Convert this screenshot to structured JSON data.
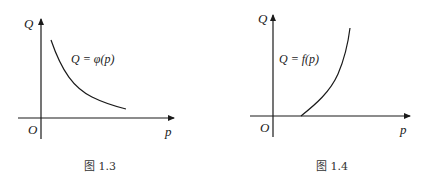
{
  "figures": [
    {
      "id": "fig-1-3",
      "caption": "图 1.3",
      "y_axis_label": "Q",
      "x_axis_label": "p",
      "origin_label": "O",
      "curve_label": "Q = φ(p)",
      "curve_type": "decreasing convex (demand)"
    },
    {
      "id": "fig-1-4",
      "caption": "图 1.4",
      "y_axis_label": "Q",
      "x_axis_label": "p",
      "origin_label": "O",
      "curve_label": "Q = f(p)",
      "curve_type": "increasing convex from positive p-intercept (supply)"
    }
  ],
  "colors": {
    "stroke": "#1a1a1a",
    "background": "#ffffff"
  }
}
